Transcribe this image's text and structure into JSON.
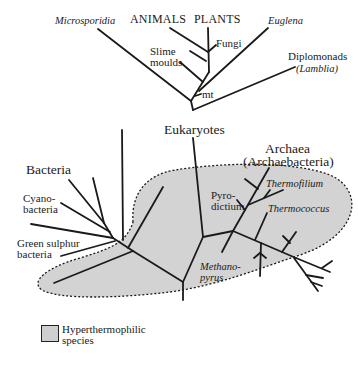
{
  "diagram": {
    "type": "unrooted phylogenetic tree",
    "colors": {
      "line": "#1a1a1a",
      "hyperthermophile_fill": "#d3d3d3",
      "boundary": "#1a1a1a"
    },
    "groups": {
      "eukaryotes": "Eukaryotes",
      "bacteria": "Bacteria",
      "archaea": "Archaea",
      "archaea_alt": "(Archaebacteria)"
    },
    "taxa": {
      "microsporidia": "Microsporidia",
      "animals": "ANIMALS",
      "plants": "PLANTS",
      "euglena": "Euglena",
      "fungi": "Fungi",
      "slime_moulds_1": "Slime",
      "slime_moulds_2": "moulds",
      "mt": "mt",
      "diplomonads": "Diplomonads",
      "lamblia": "(Lamblia)",
      "cyano_1": "Cyano-",
      "cyano_2": "bacteria",
      "green_sulphur_1": "Green sulphur",
      "green_sulphur_2": "bacteria",
      "pyrodictium_1": "Pyro-",
      "pyrodictium_2": "dictium",
      "thermofilium": "Thermofilium",
      "thermococcus": "Thermococcus",
      "methanopyrus_1": "Methano-",
      "methanopyrus_2": "pyrus"
    },
    "legend": {
      "line1": "Hyperthermophilic",
      "line2": "species"
    }
  }
}
